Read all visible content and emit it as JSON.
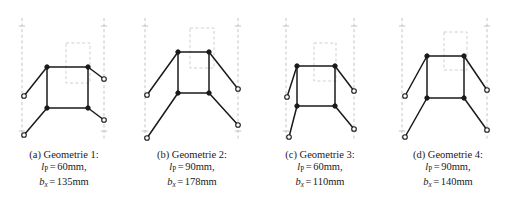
{
  "figure": {
    "style": {
      "link_color": "#1a1a1a",
      "node_fill": "#1a1a1a",
      "node_open_fill": "#ffffff",
      "guide_color": "#bdbdbd",
      "ghost_color": "#c9c9c9",
      "background": "#ffffff"
    },
    "panels": [
      {
        "key": "a",
        "caption": {
          "label": "(a)",
          "name": "Geometrie 1:",
          "title": "(a) Geometrie 1:",
          "lines": [
            {
              "var": "l",
              "sub": "P",
              "sub_style": "upright",
              "value": "60mm",
              "suffix": ","
            },
            {
              "var": "b",
              "sub": "x",
              "sub_style": "italic",
              "value": "135mm",
              "suffix": ""
            }
          ]
        },
        "guides": {
          "left_x": 22,
          "right_x": 104,
          "top_y": 18,
          "bottom_y": 139,
          "tick_top_y": 26,
          "tick_bottom_y": 131
        },
        "box": {
          "x1": 47,
          "y1": 67,
          "x2": 88,
          "y2": 108
        },
        "ghost_rect": {
          "x": 66,
          "y": 43,
          "w": 24,
          "h": 40
        },
        "arms": [
          {
            "from": "top-left",
            "to_x": 24,
            "to_y": 96
          },
          {
            "from": "top-right",
            "to_x": 104,
            "to_y": 79
          },
          {
            "from": "bottom-left",
            "to_x": 24,
            "to_y": 135
          },
          {
            "from": "bottom-right",
            "to_x": 104,
            "to_y": 120
          }
        ]
      },
      {
        "key": "b",
        "caption": {
          "label": "(b)",
          "name": "Geometrie 2:",
          "title": "(b) Geometrie 2:",
          "lines": [
            {
              "var": "l",
              "sub": "P",
              "sub_style": "upright",
              "value": "90mm",
              "suffix": ","
            },
            {
              "var": "b",
              "sub": "x",
              "sub_style": "italic",
              "value": "178mm",
              "suffix": ""
            }
          ]
        },
        "guides": {
          "left_x": 17,
          "right_x": 110,
          "top_y": 18,
          "bottom_y": 139,
          "tick_top_y": 26,
          "tick_bottom_y": 131
        },
        "box": {
          "x1": 50,
          "y1": 52,
          "x2": 81,
          "y2": 93
        },
        "ghost_rect": {
          "x": 62,
          "y": 28,
          "w": 24,
          "h": 40
        },
        "arms": [
          {
            "from": "top-left",
            "to_x": 19,
            "to_y": 95
          },
          {
            "from": "top-right",
            "to_x": 110,
            "to_y": 89
          },
          {
            "from": "bottom-left",
            "to_x": 19,
            "to_y": 138
          },
          {
            "from": "bottom-right",
            "to_x": 110,
            "to_y": 125
          }
        ]
      },
      {
        "key": "c",
        "caption": {
          "label": "(c)",
          "name": "Geometrie 3:",
          "title": "(c) Geometrie 3:",
          "lines": [
            {
              "var": "l",
              "sub": "P",
              "sub_style": "upright",
              "value": "60mm",
              "suffix": ","
            },
            {
              "var": "b",
              "sub": "x",
              "sub_style": "italic",
              "value": "110mm",
              "suffix": ""
            }
          ]
        },
        "guides": {
          "left_x": 30,
          "right_x": 98,
          "top_y": 18,
          "bottom_y": 139,
          "tick_top_y": 26,
          "tick_bottom_y": 131
        },
        "box": {
          "x1": 41,
          "y1": 66,
          "x2": 79,
          "y2": 106
        },
        "ghost_rect": {
          "x": 58,
          "y": 43,
          "w": 22,
          "h": 38
        },
        "arms": [
          {
            "from": "top-left",
            "to_x": 31,
            "to_y": 97
          },
          {
            "from": "top-right",
            "to_x": 98,
            "to_y": 91
          },
          {
            "from": "bottom-left",
            "to_x": 33,
            "to_y": 137
          },
          {
            "from": "bottom-right",
            "to_x": 98,
            "to_y": 129
          }
        ]
      },
      {
        "key": "d",
        "caption": {
          "label": "(d)",
          "name": "Geometrie 4:",
          "title": "(d) Geometrie 4:",
          "lines": [
            {
              "var": "l",
              "sub": "P",
              "sub_style": "upright",
              "value": "90mm",
              "suffix": ","
            },
            {
              "var": "b",
              "sub": "x",
              "sub_style": "italic",
              "value": "140mm",
              "suffix": ""
            }
          ]
        },
        "guides": {
          "left_x": 18,
          "right_x": 103,
          "top_y": 18,
          "bottom_y": 139,
          "tick_top_y": 26,
          "tick_bottom_y": 131
        },
        "box": {
          "x1": 43,
          "y1": 56,
          "x2": 80,
          "y2": 98
        },
        "ghost_rect": {
          "x": 60,
          "y": 32,
          "w": 23,
          "h": 38
        },
        "arms": [
          {
            "from": "top-left",
            "to_x": 21,
            "to_y": 96
          },
          {
            "from": "top-right",
            "to_x": 103,
            "to_y": 90
          },
          {
            "from": "bottom-left",
            "to_x": 21,
            "to_y": 137
          },
          {
            "from": "bottom-right",
            "to_x": 103,
            "to_y": 130
          }
        ]
      }
    ]
  }
}
